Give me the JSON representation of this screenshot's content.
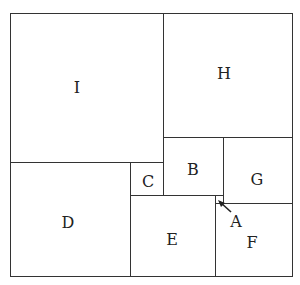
{
  "diagram": {
    "type": "squared-rectangle-dissection",
    "squares": [
      {
        "label": "I",
        "x": 10,
        "y": 13,
        "w": 153,
        "h": 149
      },
      {
        "label": "H",
        "x": 163,
        "y": 13,
        "w": 129,
        "h": 124
      },
      {
        "label": "D",
        "x": 10,
        "y": 162,
        "w": 120,
        "h": 114
      },
      {
        "label": "C",
        "x": 130,
        "y": 162,
        "w": 33,
        "h": 34
      },
      {
        "label": "B",
        "x": 163,
        "y": 137,
        "w": 60,
        "h": 59
      },
      {
        "label": "G",
        "x": 223,
        "y": 137,
        "w": 69,
        "h": 66
      },
      {
        "label": "E",
        "x": 130,
        "y": 195,
        "w": 85,
        "h": 81
      },
      {
        "label": "F",
        "x": 215,
        "y": 203,
        "w": 77,
        "h": 73
      },
      {
        "label": "A",
        "x": 215,
        "y": 195,
        "w": 8,
        "h": 8
      }
    ],
    "labels": {
      "I": "I",
      "H": "H",
      "D": "D",
      "C": "C",
      "B": "B",
      "G": "G",
      "E": "E",
      "F": "F",
      "A": "A"
    },
    "colors": {
      "line": "#333333",
      "background": "#ffffff",
      "text": "#222222"
    }
  }
}
